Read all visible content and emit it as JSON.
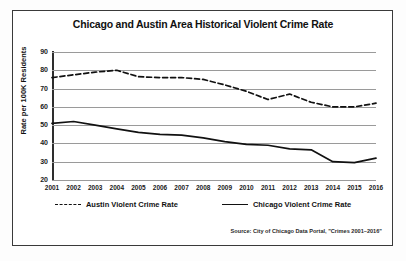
{
  "chart_data": {
    "type": "line",
    "title": "Chicago and Austin Area Historical Violent Crime Rate",
    "xlabel": "",
    "ylabel": "Rate per 100K Residents",
    "ylim": [
      20,
      90
    ],
    "yticks": [
      20,
      30,
      40,
      50,
      60,
      70,
      80,
      90
    ],
    "grid": true,
    "legend_position": "bottom",
    "categories": [
      2001,
      2002,
      2003,
      2004,
      2005,
      2006,
      2007,
      2008,
      2009,
      2010,
      2011,
      2012,
      2013,
      2014,
      2015,
      2016
    ],
    "series": [
      {
        "name": "Austin Violent Crime Rate",
        "style": "dashed",
        "color": "#111111",
        "values": [
          76,
          77.5,
          79,
          80,
          76.5,
          76,
          76,
          75,
          72,
          68.5,
          64,
          67,
          62.5,
          60,
          60,
          62
        ]
      },
      {
        "name": "Chicago Violent Crime Rate",
        "style": "solid",
        "color": "#111111",
        "values": [
          51,
          52,
          50,
          48,
          46,
          45,
          44.5,
          43,
          41,
          39.5,
          39,
          37,
          36.5,
          30,
          29.5,
          32
        ]
      }
    ],
    "source": "Source: City of Chicago Data Portal, \"Crimes 2001–2016\""
  },
  "legend": {
    "items": [
      {
        "label": "Austin Violent Crime Rate",
        "style": "dashed"
      },
      {
        "label": "Chicago Violent Crime Rate",
        "style": "solid"
      }
    ]
  }
}
